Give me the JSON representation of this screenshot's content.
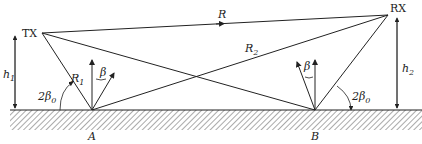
{
  "diagram": {
    "nodes": {
      "tx": {
        "label": "TX",
        "x": 42,
        "y": 33
      },
      "rx": {
        "label": "RX",
        "x": 388,
        "y": 15
      },
      "a": {
        "label": "A",
        "x": 92,
        "y": 110
      },
      "b": {
        "label": "B",
        "x": 315,
        "y": 110
      }
    },
    "paths": {
      "direct": {
        "label": "R"
      },
      "r1": {
        "label": "R",
        "sub": "1"
      },
      "r2": {
        "label": "R",
        "sub": "2"
      }
    },
    "heights": {
      "h1": {
        "label": "h",
        "sub": "1"
      },
      "h2": {
        "label": "h",
        "sub": "2"
      }
    },
    "angles": {
      "beta": "β",
      "two_beta0_left": {
        "prefix": "2",
        "sym": "β",
        "sub": "0"
      },
      "two_beta0_right": {
        "prefix": "2",
        "sym": "β",
        "sub": "0"
      }
    },
    "colors": {
      "line": "#222222",
      "ground": "#333333"
    }
  }
}
